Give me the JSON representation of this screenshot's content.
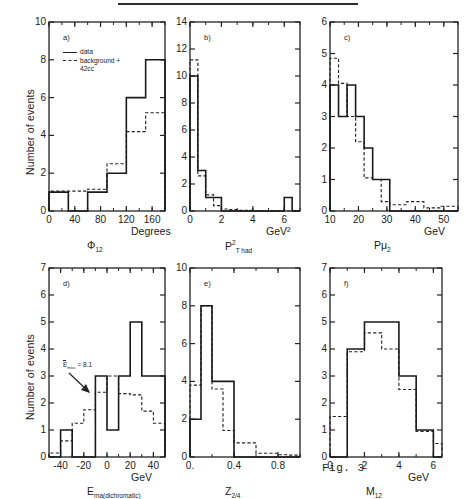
{
  "figure": {
    "number_label": "Fig. 3",
    "yaxis_label": "Number of events",
    "legend": {
      "data": "data",
      "background": "background +",
      "background2": "42cc"
    }
  },
  "panels": [
    {
      "id": "a",
      "tag": "a)",
      "xlabel_unit": "Degrees",
      "xlabel_var": "Φ",
      "xlabel_sub": "12",
      "xticks": [
        "0",
        "40",
        "80",
        "120",
        "160"
      ],
      "yticks": [
        "0",
        "2",
        "4",
        "6",
        "8",
        "10"
      ],
      "xlim": [
        0,
        180
      ],
      "ylim": [
        0,
        10
      ],
      "xtickvals": [
        0,
        40,
        80,
        120,
        160
      ],
      "bin_edges": [
        0,
        30,
        60,
        90,
        120,
        150,
        180
      ],
      "data": [
        1,
        0,
        1,
        2,
        6,
        8
      ],
      "background": [
        1.05,
        1.05,
        1.15,
        2.5,
        4.2,
        5.2
      ],
      "has_legend": true
    },
    {
      "id": "b",
      "tag": "b)",
      "xlabel_unit": "GeV²",
      "xlabel_var": "P",
      "xlabel_sup": "2",
      "xlabel_sub": "T had",
      "xticks": [
        "0",
        "2",
        "4",
        "6"
      ],
      "yticks": [
        "0",
        "2",
        "4",
        "6",
        "8",
        "10",
        "12",
        "14"
      ],
      "xlim": [
        0,
        7
      ],
      "ylim": [
        0,
        14
      ],
      "xtickvals": [
        0,
        2,
        4,
        6
      ],
      "bin_edges": [
        0,
        0.5,
        1.0,
        1.5,
        2.0,
        2.5,
        3.0,
        3.5,
        4.0,
        4.5,
        5.0,
        5.5,
        6.0,
        6.5,
        7.0
      ],
      "data": [
        10,
        3,
        1,
        1,
        0,
        0,
        0,
        0,
        0,
        0,
        0,
        0,
        1,
        0
      ],
      "background": [
        11.2,
        2.6,
        1.2,
        0.4,
        0.15,
        0.1,
        0.05,
        0.05,
        0,
        0,
        0,
        0,
        0,
        0
      ],
      "has_legend": false
    },
    {
      "id": "c",
      "tag": "c)",
      "xlabel_unit": "GeV",
      "xlabel_var": "Pμ",
      "xlabel_sub": "2",
      "xticks": [
        "10",
        "20",
        "30",
        "40",
        "50"
      ],
      "yticks": [
        "0",
        "1",
        "2",
        "3",
        "4",
        "5",
        "6"
      ],
      "xlim": [
        10,
        55
      ],
      "ylim": [
        0,
        6
      ],
      "xtickvals": [
        10,
        20,
        30,
        40,
        50
      ],
      "bin_edges": [
        10,
        13,
        16,
        19,
        22,
        25,
        28,
        31,
        34,
        37,
        40,
        43,
        46,
        49,
        52,
        55
      ],
      "data": [
        4,
        3,
        4,
        3,
        2,
        1,
        1,
        0,
        0,
        0,
        0,
        0,
        0,
        0,
        0
      ],
      "background": [
        4.85,
        4.05,
        3.0,
        2.2,
        1.05,
        1.0,
        0.3,
        0.2,
        0.2,
        0.3,
        0.3,
        0.1,
        0.1,
        0.15,
        0.15
      ],
      "has_legend": false
    },
    {
      "id": "d",
      "tag": "d)",
      "xlabel_unit": "GeV",
      "xlabel_var": "E",
      "xlabel_sub": "ma(dichromatic)",
      "xticks": [
        "-40",
        "-20",
        "0",
        "20",
        "40"
      ],
      "yticks": [
        "0",
        "1",
        "2",
        "3",
        "4",
        "5",
        "6",
        "7"
      ],
      "xlim": [
        -50,
        50
      ],
      "ylim": [
        0,
        7
      ],
      "xtickvals": [
        -40,
        -20,
        0,
        20,
        40
      ],
      "bin_edges": [
        -50,
        -40,
        -30,
        -20,
        -10,
        0,
        10,
        20,
        30,
        40,
        50
      ],
      "data": [
        0,
        1,
        0,
        0,
        3,
        1,
        3,
        5,
        3,
        3
      ],
      "background": [
        0.15,
        0.6,
        1.25,
        1.75,
        2.4,
        3.0,
        2.35,
        2.3,
        1.7,
        1.25
      ],
      "annotation": "E        = 8.1",
      "annotation_var": "E",
      "annotation_sub": "miss",
      "annotation_val": "= 8.1",
      "has_legend": false
    },
    {
      "id": "e",
      "tag": "e)",
      "xlabel_unit": "",
      "xlabel_var": "Z",
      "xlabel_sub": "2/4",
      "xticks": [
        "0.",
        "0.4",
        "0.8"
      ],
      "yticks": [
        "0",
        "2",
        "4",
        "6",
        "8",
        "10"
      ],
      "xlim": [
        0,
        1
      ],
      "ylim": [
        0,
        10
      ],
      "xtickvals": [
        0,
        0.4,
        0.8
      ],
      "bin_edges": [
        0,
        0.1,
        0.2,
        0.3,
        0.4,
        0.5,
        0.6,
        0.7,
        0.8,
        0.9,
        1.0
      ],
      "data": [
        2,
        8,
        4,
        4,
        0,
        0,
        0,
        0,
        0,
        0
      ],
      "background": [
        3.8,
        8.0,
        3.6,
        1.4,
        0.75,
        0.75,
        0.2,
        0.2,
        0.12,
        0.1
      ],
      "has_legend": false
    },
    {
      "id": "f",
      "tag": "f)",
      "xlabel_unit": "GeV",
      "xlabel_var": "M",
      "xlabel_sub": "12",
      "xticks": [
        "0",
        "2",
        "4",
        "6"
      ],
      "yticks": [
        "0",
        "1",
        "2",
        "3",
        "4",
        "5",
        "6",
        "7"
      ],
      "xlim": [
        0,
        6.5
      ],
      "ylim": [
        0,
        7
      ],
      "xtickvals": [
        0,
        2,
        4,
        6
      ],
      "bin_edges": [
        0,
        1,
        2,
        3,
        4,
        5,
        6,
        6.5
      ],
      "data": [
        0,
        4,
        5,
        5,
        3,
        1,
        0
      ],
      "background": [
        1.5,
        3.9,
        4.6,
        4.0,
        2.5,
        0.95,
        0.5
      ],
      "has_legend": false
    }
  ]
}
